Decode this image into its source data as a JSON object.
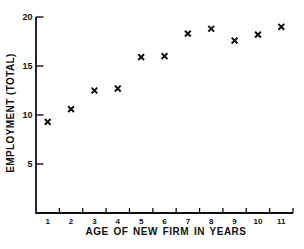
{
  "figure": {
    "background": "#ffffff",
    "ink_color": "#111111",
    "marker_glyph": "heavy-x"
  },
  "chart_data": {
    "type": "scatter",
    "title": "",
    "xlabel": "AGE OF NEW FIRM IN YEARS",
    "ylabel": "EMPLOYMENT (TOTAL)",
    "x": [
      1,
      2,
      3,
      4,
      5,
      6,
      7,
      8,
      9,
      10,
      11
    ],
    "y": [
      9.3,
      10.6,
      12.5,
      12.7,
      15.9,
      16.0,
      18.3,
      18.8,
      17.6,
      18.2,
      19.0
    ],
    "xlim": [
      0.5,
      11.5
    ],
    "ylim": [
      0,
      20
    ],
    "x_ticks": [
      1,
      2,
      3,
      4,
      5,
      6,
      7,
      8,
      9,
      10,
      11
    ],
    "x_tick_style": "bin-edges-at-half-years",
    "y_ticks": [
      5,
      10,
      15,
      20
    ],
    "grid": false,
    "legend": null,
    "marker": "x"
  }
}
